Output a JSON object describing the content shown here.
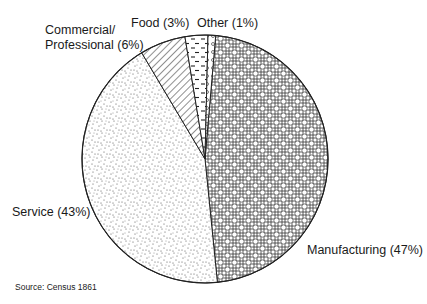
{
  "chart_data": {
    "type": "pie",
    "title": "",
    "categories": [
      "Manufacturing",
      "Service",
      "Commercial/ Professional",
      "Food",
      "Other"
    ],
    "values": [
      47,
      43,
      6,
      3,
      1
    ],
    "unit": "%",
    "slice_patterns": [
      "basketweave-circles",
      "stipple-dots",
      "diagonal-hatch",
      "dashes",
      "small-circles"
    ],
    "legend": "none (direct labels)",
    "labels": {
      "manufacturing": "Manufacturing (47%)",
      "service": "Service (43%)",
      "commercial_line1": "Commercial/",
      "commercial_line2": "Professional (6%)",
      "food": "Food (3%)",
      "other": "Other (1%)"
    },
    "source": "Source: Census 1861"
  }
}
